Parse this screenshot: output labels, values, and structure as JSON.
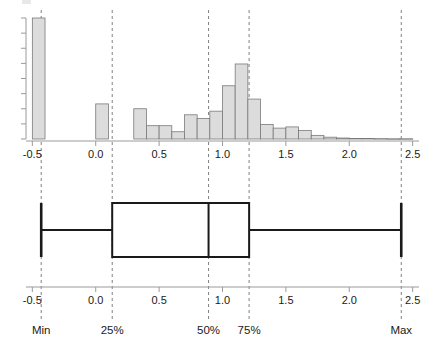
{
  "figure": {
    "title": "",
    "subtitle": ""
  },
  "axis": {
    "tick_labels": [
      "-0.5",
      "0.0",
      "0.5",
      "1.0",
      "1.5",
      "2.0",
      "2.5"
    ],
    "tick_values": [
      -0.5,
      0.0,
      0.5,
      1.0,
      1.5,
      2.0,
      2.5
    ],
    "xmin": -0.55,
    "xmax": 2.55
  },
  "quantile_labels": [
    {
      "key": "min",
      "text": "Min",
      "value": -0.43
    },
    {
      "key": "q25",
      "text": "25%",
      "value": 0.13
    },
    {
      "key": "q50",
      "text": "50%",
      "value": 0.89
    },
    {
      "key": "q75",
      "text": "75%",
      "value": 1.21
    },
    {
      "key": "max",
      "text": "Max",
      "value": 2.41
    }
  ],
  "colors": {
    "bar_fill": "#dcdcdc",
    "bar_stroke": "#7a7a7a",
    "axis": "#9a9a9a",
    "dashed_ref": "#808080",
    "box_stroke": "#1a1a1a",
    "background": "#ffffff"
  },
  "chart_data": [
    {
      "type": "bar",
      "name": "histogram",
      "title": "",
      "xlabel": "",
      "ylabel": "",
      "xlim": [
        -0.55,
        2.55
      ],
      "ylim": [
        0,
        100
      ],
      "grid": false,
      "legend": "none",
      "bin_width": 0.1,
      "bin_left_edges": [
        -0.5,
        -0.4,
        -0.3,
        -0.2,
        -0.1,
        0.0,
        0.1,
        0.2,
        0.3,
        0.4,
        0.5,
        0.6,
        0.7,
        0.8,
        0.9,
        1.0,
        1.1,
        1.2,
        1.3,
        1.4,
        1.5,
        1.6,
        1.7,
        1.8,
        1.9,
        2.0,
        2.1,
        2.2,
        2.3,
        2.4
      ],
      "values": [
        100,
        0,
        0,
        0,
        0,
        29,
        0,
        0,
        25,
        11,
        11,
        6,
        20,
        17,
        23,
        44,
        62,
        33,
        12,
        9,
        10,
        7,
        3,
        1.5,
        0.8,
        0.5,
        0.4,
        0.3,
        0.2,
        0.2
      ],
      "yaxis_ticks": 8,
      "yaxis_tick_labels": []
    },
    {
      "type": "boxplot",
      "name": "box-and-whisker",
      "title": "",
      "xlabel": "",
      "xlim": [
        -0.55,
        2.55
      ],
      "min": -0.43,
      "q1": 0.13,
      "median": 0.89,
      "q3": 1.21,
      "max": 2.41,
      "orientation": "horizontal"
    }
  ]
}
